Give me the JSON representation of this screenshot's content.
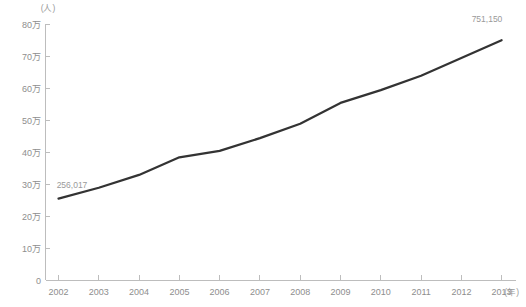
{
  "chart_data": {
    "type": "line",
    "title": "",
    "subtitle": "",
    "xlabel": "(年)",
    "ylabel": "(人)",
    "x": [
      "2002",
      "2003",
      "2004",
      "2005",
      "2006",
      "2007",
      "2008",
      "2009",
      "2010",
      "2011",
      "2012",
      "2013"
    ],
    "categories": [
      "2002",
      "2003",
      "2004",
      "2005",
      "2006",
      "2007",
      "2008",
      "2009",
      "2010",
      "2011",
      "2012",
      "2013"
    ],
    "values": [
      256017,
      290000,
      330000,
      385000,
      405000,
      445000,
      490000,
      555000,
      595000,
      640000,
      695000,
      751150
    ],
    "series": [
      {
        "name": "",
        "values": [
          256017,
          290000,
          330000,
          385000,
          405000,
          445000,
          490000,
          555000,
          595000,
          640000,
          695000,
          751150
        ]
      }
    ],
    "ylim": [
      0,
      800000
    ],
    "xlim": [
      "2002",
      "2013"
    ],
    "ytick_values": [
      0,
      100000,
      200000,
      300000,
      400000,
      500000,
      600000,
      700000,
      800000
    ],
    "ytick_labels": [
      "0",
      "10万",
      "20万",
      "30万",
      "40万",
      "50万",
      "60万",
      "70万",
      "80万"
    ],
    "xtick_labels": [
      "2002",
      "2003",
      "2004",
      "2005",
      "2006",
      "2007",
      "2008",
      "2009",
      "2010",
      "2011",
      "2012",
      "2013"
    ],
    "grid": false,
    "legend": false,
    "legend_position": "none",
    "annotations": [
      {
        "label": "256,017",
        "x": "2002",
        "y": 256017
      },
      {
        "label": "751,150",
        "x": "2013",
        "y": 751150
      }
    ],
    "line_color": "#333333",
    "axis_color": "#bdbdbd",
    "label_color": "#8e8e8e",
    "background_color": "#ffffff"
  },
  "axes": {
    "y_unit": "(人)",
    "x_unit": "(年)",
    "first_point_label": "256,017",
    "last_point_label": "751,150"
  }
}
